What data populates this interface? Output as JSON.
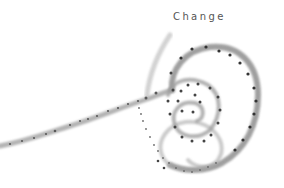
{
  "artwork": {
    "title": "Change",
    "description": "Ink-wash spiral with a trailing brush stroke and dotted path",
    "colors": {
      "background": "#ffffff",
      "title_text": "#555555",
      "stroke": "#9a9a9a",
      "stroke_dark": "#6e6e6e",
      "dot": "#3c3c3c"
    }
  }
}
